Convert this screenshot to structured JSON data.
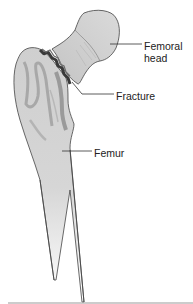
{
  "figure": {
    "labels": {
      "femoral_head_line1": "Femoral",
      "femoral_head_line2": "head",
      "fracture": "Fracture",
      "femur": "Femur"
    },
    "colors": {
      "bone_fill": "#cfcfcf",
      "bone_light": "#dedede",
      "bone_shadow": "#9a9a9a",
      "fracture_dark": "#3a3a3a",
      "outline": "#444444",
      "leader_line": "#333333",
      "bottom_rule": "#999999"
    }
  }
}
